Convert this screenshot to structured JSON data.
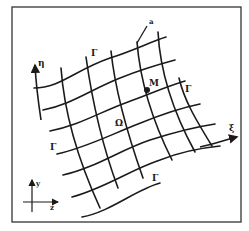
{
  "figure": {
    "type": "curvilinear-grid-diagram",
    "labels": {
      "eta": "η",
      "xi": "ξ",
      "point": "M",
      "region": "Ω",
      "boundary": "Γ",
      "pointer": "a",
      "axis_y": "y",
      "axis_z": "z"
    },
    "colors": {
      "ink": "#1a1a1a",
      "background": "#ffffff",
      "frame": "#333333"
    }
  }
}
